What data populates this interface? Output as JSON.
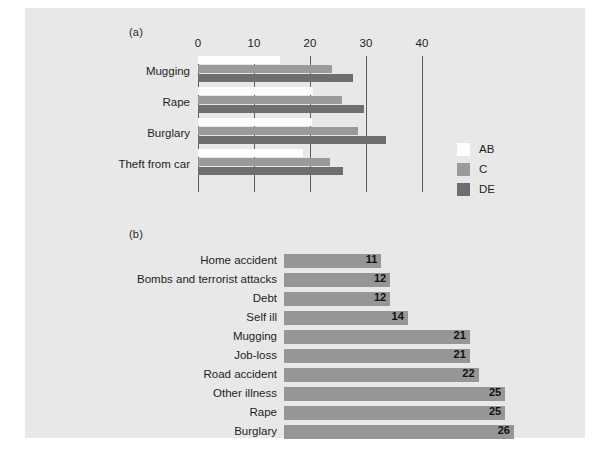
{
  "figure": {
    "background": "#e8e8e8",
    "panel_a_tag": "(a)",
    "panel_b_tag": "(b)"
  },
  "chart_data": [
    {
      "type": "bar",
      "orientation": "horizontal",
      "panel": "(a)",
      "title": "",
      "xlabel": "",
      "ylabel": "",
      "xlim": [
        0,
        40
      ],
      "xticks": [
        0,
        10,
        20,
        30,
        40
      ],
      "xtick_labels": [
        "0",
        "10",
        "20",
        "30",
        "40"
      ],
      "grid": true,
      "legend_position": "right",
      "categories": [
        "Mugging",
        "Rape",
        "Burglary",
        "Theft from car"
      ],
      "series": [
        {
          "name": "AB",
          "color": "#fdfdfd",
          "values": [
            14.6,
            20.5,
            20.4,
            18.7
          ]
        },
        {
          "name": "C",
          "color": "#9a9a9a",
          "values": [
            23.9,
            25.7,
            28.5,
            23.6
          ]
        },
        {
          "name": "DE",
          "color": "#6e6e6e",
          "values": [
            27.7,
            29.6,
            33.6,
            25.9
          ]
        }
      ]
    },
    {
      "type": "bar",
      "orientation": "horizontal",
      "panel": "(b)",
      "title": "",
      "xlabel": "",
      "ylabel": "",
      "xlim": [
        0,
        26
      ],
      "grid": false,
      "bar_color": "#969696",
      "categories": [
        "Home accident",
        "Bombs and terrorist attacks",
        "Debt",
        "Self ill",
        "Mugging",
        "Job-loss",
        "Road accident",
        "Other illness",
        "Rape",
        "Burglary"
      ],
      "values": [
        11,
        12,
        12,
        14,
        21,
        21,
        22,
        25,
        25,
        26
      ],
      "value_labels": [
        "11",
        "12",
        "12",
        "14",
        "21",
        "21",
        "22",
        "25",
        "25",
        "26"
      ]
    }
  ]
}
